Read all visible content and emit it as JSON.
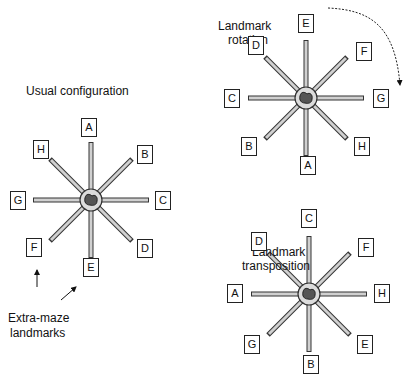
{
  "titles": {
    "usual": "Usual configuration",
    "rotation_l1": "Landmark",
    "rotation_l2": "rotation",
    "transposition_l1": "Landmark",
    "transposition_l2": "transposition",
    "extra_l1": "Extra-maze",
    "extra_l2": "landmarks"
  },
  "mazes": {
    "usual": {
      "center": [
        91,
        200
      ],
      "labels": {
        "n": "A",
        "ne": "B",
        "e": "C",
        "se": "D",
        "s": "E",
        "sw": "F",
        "w": "G",
        "nw": "H"
      }
    },
    "rotation": {
      "center": [
        306,
        98
      ],
      "labels": {
        "n": "E",
        "ne": "F",
        "e": "G",
        "se": "H",
        "s": "A",
        "sw": "B",
        "w": "C",
        "nw": "D"
      }
    },
    "transposition": {
      "center": [
        309,
        294
      ],
      "labels": {
        "n": "C",
        "ne": "F",
        "e": "H",
        "se": "E",
        "s": "B",
        "sw": "G",
        "w": "A",
        "nw": "D"
      }
    }
  },
  "colors": {
    "arm": "#c8c8c8",
    "outline": "#333333",
    "platform": "#d8d8d8"
  }
}
